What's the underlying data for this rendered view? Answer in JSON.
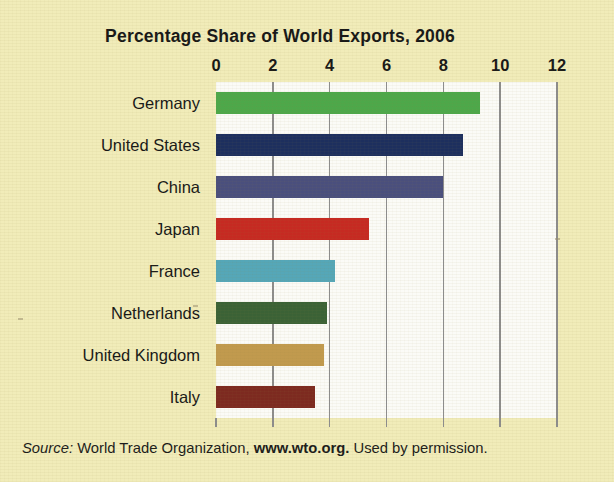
{
  "chart_data": {
    "type": "bar",
    "orientation": "horizontal",
    "title": "Percentage Share of World Exports, 2006",
    "xlabel": "",
    "ylabel": "",
    "categories": [
      "Germany",
      "United States",
      "China",
      "Japan",
      "France",
      "Netherlands",
      "United Kingdom",
      "Italy"
    ],
    "values": [
      9.3,
      8.7,
      8.0,
      5.4,
      4.2,
      3.9,
      3.8,
      3.5
    ],
    "xlim": [
      0,
      12
    ],
    "xticks": [
      0,
      2,
      4,
      6,
      8,
      10,
      12
    ],
    "xtick_labels": [
      "0",
      "2",
      "4",
      "6",
      "8",
      "10",
      "12"
    ],
    "grid": "vertical",
    "legend": "none",
    "bar_colors": [
      "#4da84a",
      "#1d2f5e",
      "#4a4f7d",
      "#c62a22",
      "#55a7b8",
      "#3b6236",
      "#c19a4e",
      "#7d2a20"
    ]
  },
  "source": {
    "label": "Source:",
    "organization": "World Trade Organization,",
    "url": "www.wto.org.",
    "permission": "Used by permission."
  },
  "colors": {
    "background": "#f1ecb9",
    "plot_background": "#fbfbf7",
    "gridline": "#8d8d8d",
    "text": "#171717"
  }
}
